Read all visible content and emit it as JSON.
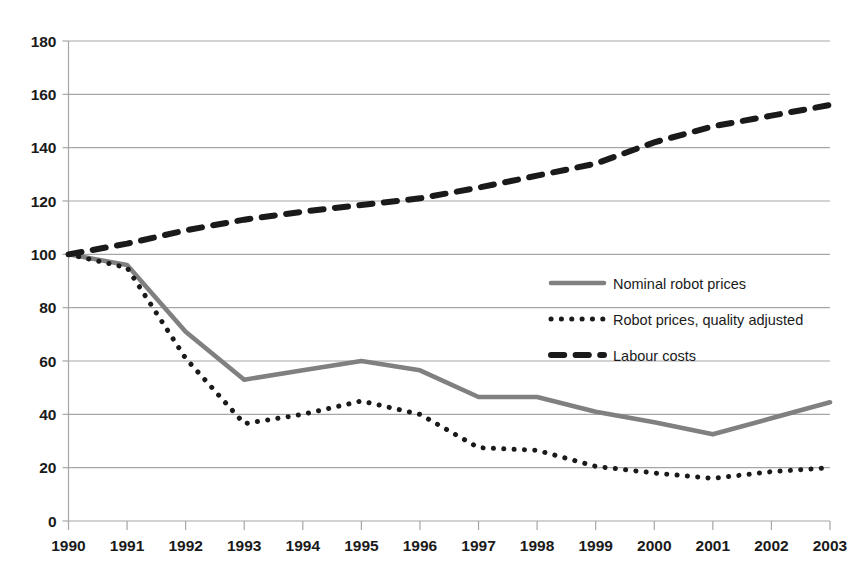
{
  "chart_data": {
    "type": "line",
    "title": "",
    "subtitle": "",
    "xlabel": "",
    "ylabel": "",
    "categories": [
      "1990",
      "1991",
      "1992",
      "1993",
      "1994",
      "1995",
      "1996",
      "1997",
      "1998",
      "1999",
      "2000",
      "2001",
      "2002",
      "2003"
    ],
    "x": [
      1990,
      1991,
      1992,
      1993,
      1994,
      1995,
      1996,
      1997,
      1998,
      1999,
      2000,
      2001,
      2002,
      2003
    ],
    "xlim": [
      1990,
      2003
    ],
    "ylim": [
      0,
      180
    ],
    "yticks": [
      0,
      20,
      40,
      60,
      80,
      100,
      120,
      140,
      160,
      180
    ],
    "ytick_labels": [
      "0",
      "20",
      "40",
      "60",
      "80",
      "100",
      "120",
      "140",
      "160",
      "180"
    ],
    "grid": true,
    "grid_axis": "y",
    "legend_position": "inside-right-upper",
    "series": [
      {
        "name": "Nominal  robot prices",
        "style": "solid",
        "color": "#808080",
        "values": [
          100,
          96,
          71,
          53,
          56.5,
          60,
          56.5,
          46.5,
          46.5,
          41,
          37,
          32.5,
          38.5,
          44.5
        ]
      },
      {
        "name": "Robot prices, quality adjusted",
        "style": "dotted",
        "color": "#1a1a1a",
        "values": [
          100,
          95,
          61,
          36.5,
          40,
          45,
          40,
          27.5,
          26.5,
          20.5,
          18,
          16,
          18.5,
          20
        ]
      },
      {
        "name": "Labour costs",
        "style": "dashed",
        "color": "#1a1a1a",
        "values": [
          100,
          104,
          109,
          113,
          116,
          118.5,
          121,
          125,
          129.5,
          134,
          142,
          148,
          152,
          156
        ]
      }
    ]
  },
  "legend": {
    "items": [
      {
        "label": "Nominal  robot prices",
        "swatch": "solid-line-swatch"
      },
      {
        "label": "Robot prices, quality adjusted",
        "swatch": "dotted-line-swatch"
      },
      {
        "label": "Labour costs",
        "swatch": "dashed-line-swatch"
      }
    ]
  }
}
